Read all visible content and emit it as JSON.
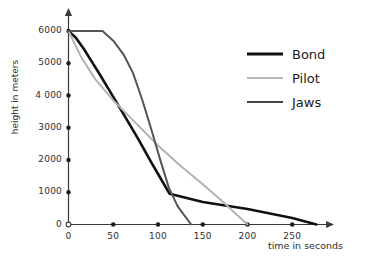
{
  "chart_data": {
    "type": "line",
    "title": "",
    "xlabel": "time in seconds",
    "ylabel": "height in meters",
    "xlim": [
      0,
      290
    ],
    "ylim": [
      0,
      6400
    ],
    "grid": false,
    "legend_position": "top-right",
    "x_ticks": [
      0,
      50,
      100,
      150,
      200,
      250
    ],
    "x_tick_labels": [
      "0",
      "50",
      "100",
      "150",
      "200",
      "250"
    ],
    "y_ticks": [
      0,
      1000,
      2000,
      3000,
      4000,
      5000,
      6000
    ],
    "y_tick_labels": [
      "0",
      "1000",
      "2000",
      "3000",
      "4 000",
      "5000",
      "6000"
    ],
    "series": [
      {
        "name": "Bond",
        "color": "#111111",
        "width": 2.6,
        "points": [
          [
            0,
            6000
          ],
          [
            8,
            5800
          ],
          [
            17,
            5450
          ],
          [
            26,
            5050
          ],
          [
            35,
            4650
          ],
          [
            48,
            4050
          ],
          [
            62,
            3400
          ],
          [
            78,
            2650
          ],
          [
            92,
            1950
          ],
          [
            104,
            1380
          ],
          [
            113,
            950
          ],
          [
            150,
            700
          ],
          [
            200,
            480
          ],
          [
            250,
            200
          ],
          [
            277,
            0
          ]
        ]
      },
      {
        "name": "Pilot",
        "color": "#b3b3b3",
        "width": 2.0,
        "points": [
          [
            0,
            6000
          ],
          [
            14,
            5200
          ],
          [
            30,
            4500
          ],
          [
            50,
            3850
          ],
          [
            75,
            3150
          ],
          [
            100,
            2450
          ],
          [
            125,
            1820
          ],
          [
            150,
            1250
          ],
          [
            175,
            640
          ],
          [
            200,
            0
          ]
        ]
      },
      {
        "name": "Jaws",
        "color": "#555555",
        "width": 2.0,
        "points": [
          [
            0,
            6000
          ],
          [
            38,
            6000
          ],
          [
            50,
            5700
          ],
          [
            62,
            5250
          ],
          [
            72,
            4700
          ],
          [
            82,
            3900
          ],
          [
            92,
            3000
          ],
          [
            102,
            2050
          ],
          [
            112,
            1150
          ],
          [
            122,
            560
          ],
          [
            137,
            0
          ]
        ]
      }
    ],
    "axis_markers_on_x": [
      0,
      50,
      100,
      150,
      200,
      250
    ],
    "origin_marker": "open-circle"
  },
  "legend": {
    "items": [
      {
        "label": "Bond",
        "color": "#111111",
        "thickness": "3px"
      },
      {
        "label": "Pilot",
        "color": "#b9b9b9",
        "thickness": "2px"
      },
      {
        "label": "Jaws",
        "color": "#444444",
        "thickness": "2px"
      }
    ]
  },
  "axes": {
    "x_title": "time in seconds",
    "y_title": "height in meters"
  }
}
